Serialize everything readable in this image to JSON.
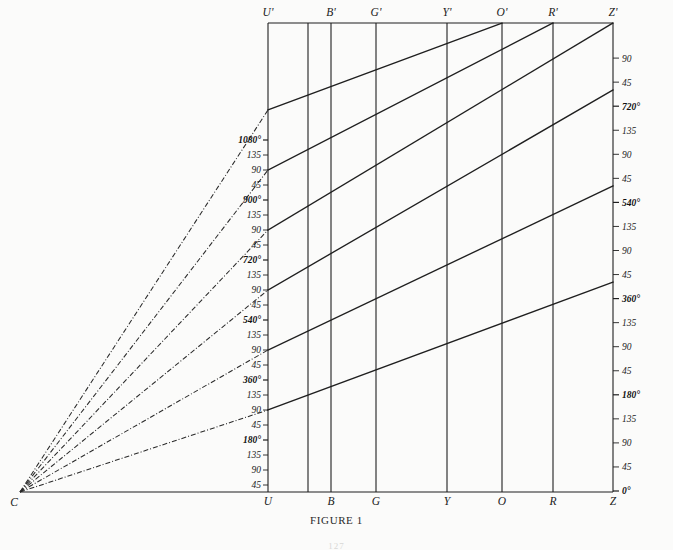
{
  "figure": {
    "caption": "FIGURE 1",
    "folio": "127",
    "origin_label": "C",
    "background_color": "#fbfbfa",
    "line_color": "#1f1f1f",
    "ray_color": "#2a2a2a"
  },
  "axes": {
    "top_labels": [
      "U'",
      "B'",
      "G'",
      "Y'",
      "O'",
      "R'",
      "Z'"
    ],
    "bottom_labels": [
      "U",
      "B",
      "G",
      "Y",
      "O",
      "R",
      "Z"
    ],
    "left_axis_name": "U-axis",
    "right_axis_name": "Z-axis",
    "left_ticks": [
      {
        "label": "1080°",
        "major": true
      },
      {
        "label": "135",
        "major": false
      },
      {
        "label": "90",
        "major": false
      },
      {
        "label": "45",
        "major": false
      },
      {
        "label": "900°",
        "major": true
      },
      {
        "label": "135",
        "major": false
      },
      {
        "label": "90",
        "major": false
      },
      {
        "label": "45",
        "major": false
      },
      {
        "label": "720°",
        "major": true
      },
      {
        "label": "135",
        "major": false
      },
      {
        "label": "90",
        "major": false
      },
      {
        "label": "45",
        "major": false
      },
      {
        "label": "540°",
        "major": true
      },
      {
        "label": "135",
        "major": false
      },
      {
        "label": "90",
        "major": false
      },
      {
        "label": "45",
        "major": false
      },
      {
        "label": "360°",
        "major": true
      },
      {
        "label": "135",
        "major": false
      },
      {
        "label": "90",
        "major": false
      },
      {
        "label": "45",
        "major": false
      },
      {
        "label": "180°",
        "major": true
      },
      {
        "label": "135",
        "major": false
      },
      {
        "label": "90",
        "major": false
      },
      {
        "label": "45",
        "major": false
      }
    ],
    "right_ticks": [
      {
        "label": "90",
        "major": false
      },
      {
        "label": "45",
        "major": false
      },
      {
        "label": "720°",
        "major": true
      },
      {
        "label": "135",
        "major": false
      },
      {
        "label": "90",
        "major": false
      },
      {
        "label": "45",
        "major": false
      },
      {
        "label": "540°",
        "major": true
      },
      {
        "label": "135",
        "major": false
      },
      {
        "label": "90",
        "major": false
      },
      {
        "label": "45",
        "major": false
      },
      {
        "label": "360°",
        "major": true
      },
      {
        "label": "135",
        "major": false
      },
      {
        "label": "90",
        "major": false
      },
      {
        "label": "45",
        "major": false
      },
      {
        "label": "180°",
        "major": true
      },
      {
        "label": "135",
        "major": false
      },
      {
        "label": "90",
        "major": false
      },
      {
        "label": "45",
        "major": false
      },
      {
        "label": "0°",
        "major": true
      }
    ]
  },
  "chart_data": {
    "type": "line",
    "title": "FIGURE 1",
    "xlabel": "",
    "ylabel": "",
    "grid": true,
    "legend_position": "none",
    "x_categories_top": [
      "U'",
      "B'",
      "G'",
      "Y'",
      "O'",
      "R'",
      "Z'"
    ],
    "x_categories_bottom": [
      "U",
      "B",
      "G",
      "Y",
      "O",
      "R",
      "Z"
    ],
    "x_positions_px": [
      268,
      331,
      376,
      447,
      502,
      553,
      613
    ],
    "extra_vertical_px": [
      308
    ],
    "left_axis_range_deg": [
      0,
      1080
    ],
    "right_axis_range_deg": [
      0,
      810
    ],
    "series": [
      {
        "name": "180° band",
        "start_deg_at_U": 180,
        "end_deg_at_Z": 180,
        "points_px": [
          [
            268,
            410
          ],
          [
            613,
            282
          ]
        ]
      },
      {
        "name": "360° band",
        "start_deg_at_U": 360,
        "end_deg_at_Z": 360,
        "points_px": [
          [
            268,
            350
          ],
          [
            613,
            186
          ]
        ]
      },
      {
        "name": "540° band",
        "start_deg_at_U": 540,
        "end_deg_at_Z": 540,
        "points_px": [
          [
            268,
            290
          ],
          [
            613,
            90
          ]
        ]
      },
      {
        "name": "720° band",
        "start_deg_at_U": 720,
        "end_deg_at_Z": 720,
        "points_px": [
          [
            268,
            230
          ],
          [
            613,
            23
          ]
        ]
      },
      {
        "name": "900° band",
        "start_deg_at_U": 900,
        "points_px": [
          [
            268,
            170
          ],
          [
            553,
            23
          ]
        ]
      },
      {
        "name": "1080° band",
        "start_deg_at_U": 1080,
        "points_px": [
          [
            268,
            110
          ],
          [
            502,
            23
          ]
        ]
      }
    ],
    "rays_from_C": [
      {
        "name": "ray-to-180",
        "from_px": [
          20,
          492
        ],
        "to_px": [
          268,
          410
        ]
      },
      {
        "name": "ray-to-360",
        "from_px": [
          20,
          492
        ],
        "to_px": [
          268,
          350
        ]
      },
      {
        "name": "ray-to-540",
        "from_px": [
          20,
          492
        ],
        "to_px": [
          268,
          290
        ]
      },
      {
        "name": "ray-to-720",
        "from_px": [
          20,
          492
        ],
        "to_px": [
          268,
          230
        ]
      },
      {
        "name": "ray-to-900",
        "from_px": [
          20,
          492
        ],
        "to_px": [
          268,
          170
        ]
      },
      {
        "name": "ray-to-1080",
        "from_px": [
          20,
          492
        ],
        "to_px": [
          268,
          110
        ]
      }
    ]
  }
}
